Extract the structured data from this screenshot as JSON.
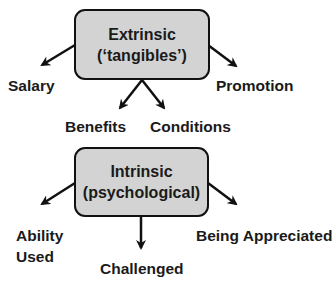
{
  "diagram": {
    "extrinsic": {
      "title_line1": "Extrinsic",
      "title_line2": "(‘tangibles’)",
      "children": [
        "Salary",
        "Benefits",
        "Conditions",
        "Promotion"
      ]
    },
    "intrinsic": {
      "title_line1": "Intrinsic",
      "title_line2": "(psychological)",
      "children": [
        "Ability Used",
        "Challenged",
        "Being Appreciated"
      ],
      "ability_line1": "Ability",
      "ability_line2": "Used"
    },
    "colors": {
      "box_fill": "#d3d3d3",
      "stroke": "#111111"
    }
  }
}
